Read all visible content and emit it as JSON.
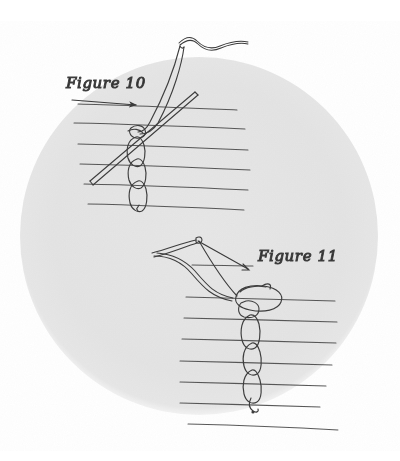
{
  "illustration": {
    "title": "Chain stitch embroidery diagram",
    "medium": "pencil drawing on paper, scanned",
    "page_background": "#ffffff",
    "vignette": {
      "shape": "circle",
      "fill": "#e4e4e4",
      "center_x": 199,
      "center_y": 236,
      "radius_x": 179,
      "radius_y": 179
    },
    "ink_color": "#3a3a3a",
    "fabric_line_color": "#4a4a4a"
  },
  "figures": [
    {
      "id": "figure-10",
      "label": "Figure 10",
      "label_x": 66,
      "label_y": 86,
      "description": "Needle pulled through fabric forming a chain stitch loop",
      "leader": {
        "from_x": 72,
        "from_y": 100,
        "to_x": 139,
        "to_y": 106,
        "arrowhead": "right"
      },
      "fabric_lines": [
        {
          "x1": 78,
          "y1": 104,
          "x2": 237,
          "y2": 110
        },
        {
          "x1": 74,
          "y1": 123,
          "x2": 245,
          "y2": 129
        },
        {
          "x1": 78,
          "y1": 144,
          "x2": 248,
          "y2": 150
        },
        {
          "x1": 80,
          "y1": 164,
          "x2": 250,
          "y2": 170
        },
        {
          "x1": 84,
          "y1": 184,
          "x2": 248,
          "y2": 190
        },
        {
          "x1": 88,
          "y1": 204,
          "x2": 244,
          "y2": 210
        }
      ],
      "chain_links": [
        {
          "cx": 136,
          "cy": 150,
          "rx": 9,
          "ry": 14
        },
        {
          "cx": 136,
          "cy": 172,
          "rx": 9,
          "ry": 14
        },
        {
          "cx": 137,
          "cy": 194,
          "rx": 9,
          "ry": 14
        }
      ],
      "needle": {
        "x1": 90,
        "y1": 180,
        "x2": 196,
        "y2": 92
      },
      "thread_tail": "wavy thread exiting top right"
    },
    {
      "id": "figure-11",
      "label": "Figure 11",
      "label_x": 258,
      "label_y": 259,
      "description": "Thread loop drawn up to tighten the next chain link",
      "leader": {
        "from_x": 198,
        "from_y": 240,
        "to_x": 249,
        "to_y": 269,
        "arrowhead": "down-right"
      },
      "fabric_lines": [
        {
          "x1": 192,
          "y1": 265,
          "x2": 253,
          "y2": 266
        },
        {
          "x1": 186,
          "y1": 297,
          "x2": 335,
          "y2": 301
        },
        {
          "x1": 184,
          "y1": 318,
          "x2": 337,
          "y2": 322
        },
        {
          "x1": 182,
          "y1": 339,
          "x2": 336,
          "y2": 343
        },
        {
          "x1": 180,
          "y1": 361,
          "x2": 332,
          "y2": 365
        },
        {
          "x1": 180,
          "y1": 382,
          "x2": 326,
          "y2": 386
        },
        {
          "x1": 180,
          "y1": 403,
          "x2": 320,
          "y2": 407
        },
        {
          "x1": 188,
          "y1": 424,
          "x2": 338,
          "y2": 430
        }
      ],
      "chain_links": [
        {
          "cx": 251,
          "cy": 330,
          "rx": 10,
          "ry": 15
        },
        {
          "cx": 253,
          "cy": 360,
          "rx": 9,
          "ry": 14
        },
        {
          "cx": 253,
          "cy": 388,
          "rx": 9,
          "ry": 14
        }
      ],
      "loop": {
        "cx": 256,
        "cy": 300,
        "rx": 22,
        "ry": 12
      },
      "needle": {
        "x1": 198,
        "y1": 241,
        "x2": 249,
        "y2": 269
      },
      "thread_tail": "thread curving down from needle eye at top"
    }
  ]
}
